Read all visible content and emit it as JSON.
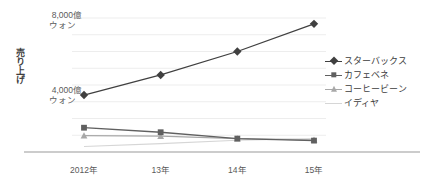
{
  "chart_data": {
    "type": "line",
    "title": "",
    "xlabel": "",
    "ylabel": "売り上げ",
    "categories": [
      "2012年",
      "13年",
      "14年",
      "15年"
    ],
    "ylim": [
      0,
      8000
    ],
    "y_ticks": [
      4000,
      8000
    ],
    "y_tick_labels": [
      {
        "value": "4,000億",
        "unit": "ウォン"
      },
      {
        "value": "8,000億",
        "unit": "ウォン"
      }
    ],
    "y_unit": "億ウォン",
    "grid": true,
    "grid_step": 1000,
    "legend_position": "right",
    "series": [
      {
        "name": "スターバックス",
        "marker": "diamond",
        "color": "#404040",
        "values": [
          3400,
          4600,
          6000,
          7650
        ]
      },
      {
        "name": "カフェベネ",
        "marker": "square",
        "color": "#606060",
        "values": [
          1450,
          1180,
          800,
          680
        ]
      },
      {
        "name": "コーヒービーン",
        "marker": "triangle",
        "color": "#a8a8a8",
        "values": [
          980,
          950,
          800,
          720
        ]
      },
      {
        "name": "イディヤ",
        "marker": "none",
        "color": "#d6d6d6",
        "values": [
          330,
          500,
          700,
          800
        ]
      }
    ]
  },
  "axis": {
    "baseline_color": "#9a9a9a",
    "grid_color": "#ededed"
  }
}
